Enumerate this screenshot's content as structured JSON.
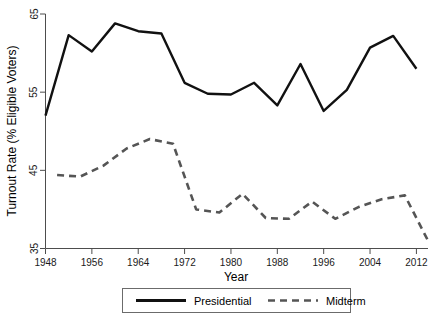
{
  "chart_data": {
    "type": "line",
    "title": "",
    "xlabel": "Year",
    "ylabel": "Turnout Rate (% Eligible Voters)",
    "xlim": [
      1948,
      2014
    ],
    "ylim": [
      35,
      65
    ],
    "xticks": [
      1948,
      1956,
      1964,
      1972,
      1980,
      1988,
      1996,
      2004,
      2012
    ],
    "yticks": [
      35,
      45,
      55,
      65
    ],
    "grid": false,
    "legend_position": "bottom",
    "series": [
      {
        "name": "Presidential",
        "style": "solid",
        "color": "#111111",
        "x": [
          1948,
          1952,
          1956,
          1960,
          1964,
          1968,
          1972,
          1976,
          1980,
          1984,
          1988,
          1992,
          1996,
          2000,
          2004,
          2008,
          2012
        ],
        "values": [
          52.0,
          62.3,
          60.2,
          63.8,
          62.8,
          62.5,
          56.2,
          54.8,
          54.7,
          56.2,
          53.3,
          58.6,
          52.6,
          55.3,
          60.7,
          62.2,
          58.0
        ]
      },
      {
        "name": "Midterm",
        "style": "dashed",
        "color": "#555555",
        "x": [
          1950,
          1954,
          1958,
          1962,
          1966,
          1970,
          1974,
          1978,
          1982,
          1986,
          1990,
          1994,
          1998,
          2002,
          2006,
          2010,
          2014
        ],
        "values": [
          44.4,
          44.2,
          45.6,
          47.8,
          49.0,
          48.4,
          40.0,
          39.6,
          42.0,
          38.9,
          38.8,
          41.0,
          38.8,
          40.3,
          41.3,
          41.8,
          36.0
        ]
      }
    ]
  },
  "axes": {
    "x_title": "Year",
    "y_title": "Turnout Rate (% Eligible Voters)",
    "x_tick_labels": [
      "1948",
      "1956",
      "1964",
      "1972",
      "1980",
      "1988",
      "1996",
      "2004",
      "2012"
    ],
    "y_tick_labels": [
      "35",
      "45",
      "55",
      "65"
    ]
  },
  "legend": {
    "entries": [
      {
        "label": "Presidential",
        "style": "solid",
        "color": "#111111"
      },
      {
        "label": "Midterm",
        "style": "dashed",
        "color": "#555555"
      }
    ]
  }
}
